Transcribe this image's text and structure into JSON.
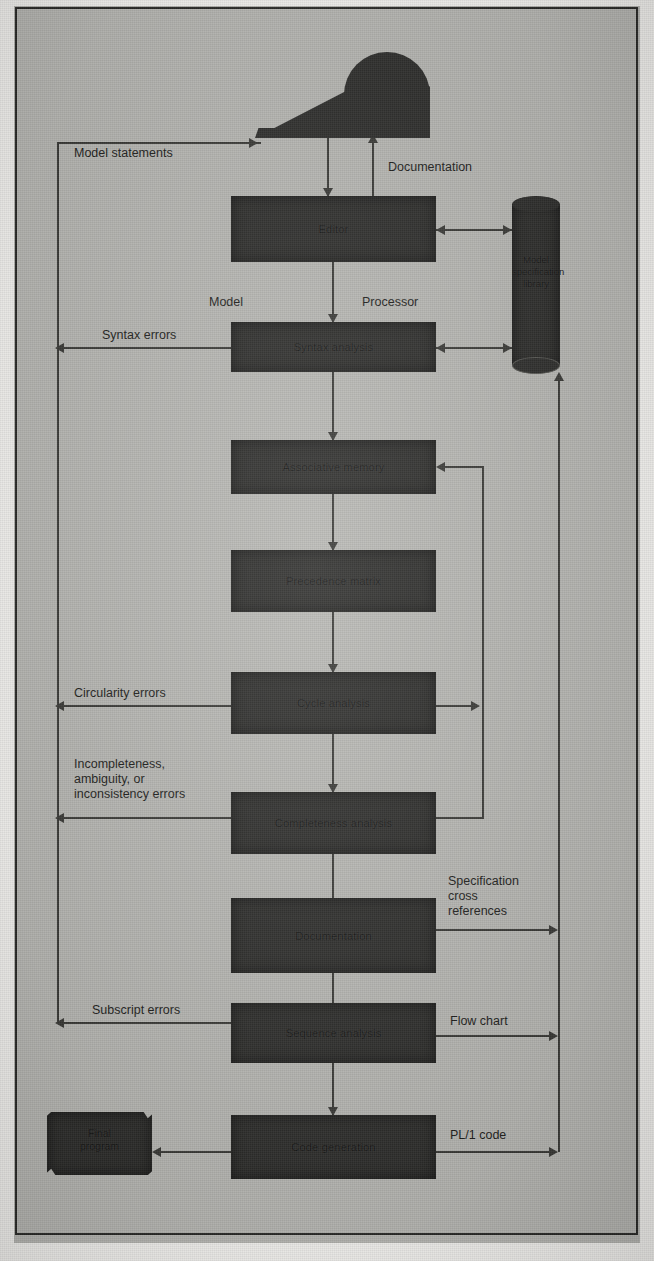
{
  "figure": {
    "type": "flowchart"
  },
  "nodes": {
    "terminal": {
      "label": ""
    },
    "editor": {
      "label": "Editor"
    },
    "library": {
      "label": "Model\nspecification\nlibrary"
    },
    "syntax_analysis": {
      "label": "Syntax analysis"
    },
    "associative_memory": {
      "label": "Associative memory"
    },
    "precedence_matrix": {
      "label": "Precedence matrix"
    },
    "cycle_analysis": {
      "label": "Cycle analysis"
    },
    "completeness_analysis": {
      "label": "Completeness analysis"
    },
    "documentation": {
      "label": "Documentation"
    },
    "sequence_analysis": {
      "label": "Sequence analysis"
    },
    "code_generation": {
      "label": "Code generation"
    },
    "final_program": {
      "label": "Final\nprogram"
    }
  },
  "edge_labels": {
    "model_statements": "Model statements",
    "documentation_flow": "Documentation",
    "model": "Model",
    "processor": "Processor",
    "syntax_errors": "Syntax errors",
    "circularity_errors": "Circularity errors",
    "incompleteness_errors": "Incompleteness,\nambiguity, or\ninconsistency errors",
    "specification_cross_references": "Specification\ncross\nreferences",
    "subscript_errors": "Subscript errors",
    "flow_chart": "Flow chart",
    "pl1_code": "PL/1 code"
  },
  "colors": {
    "paper": "#b9b9b5",
    "block_fill": "#2e2e2c",
    "line": "#3a3a37",
    "text": "#1d1d1b"
  }
}
